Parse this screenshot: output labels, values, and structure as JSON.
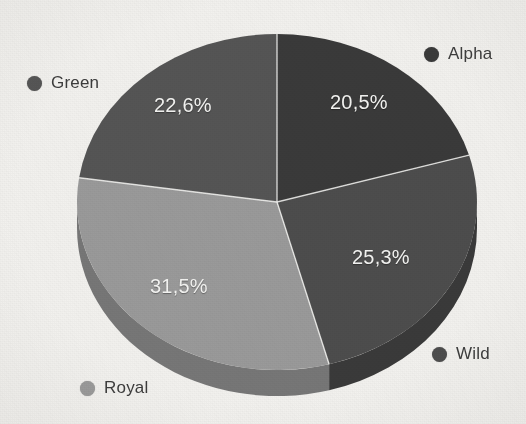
{
  "chart_data": {
    "type": "pie",
    "title": "",
    "subtitle": "",
    "xlabel": "",
    "ylabel": "",
    "decimal_separator": ",",
    "value_suffix": "%",
    "three_d": true,
    "start_angle_deg": 0,
    "direction": "clockwise",
    "legend_position": "around-pie",
    "grid": false,
    "categories": [
      "Alpha",
      "Wild",
      "Royal",
      "Green"
    ],
    "values": [
      20.5,
      25.3,
      31.5,
      22.6
    ],
    "labels": [
      "20,5%",
      "25,3%",
      "31,5%",
      "22,6%"
    ],
    "colors": [
      "#3a3a3a",
      "#4d4d4d",
      "#9a9a9a",
      "#555555"
    ],
    "side_colors": [
      "#2a2a2a",
      "#3a3a3a",
      "#777777",
      "#414141"
    ],
    "slices": [
      {
        "name": "Alpha",
        "value": 20.5,
        "label": "20,5%",
        "color": "#3a3a3a",
        "side_color": "#2a2a2a",
        "start_deg": 0,
        "end_deg": 73.8,
        "label_x": 330,
        "label_y": 91
      },
      {
        "name": "Wild",
        "value": 25.3,
        "label": "25,3%",
        "color": "#4d4d4d",
        "side_color": "#3a3a3a",
        "start_deg": 73.8,
        "end_deg": 164.9,
        "label_x": 352,
        "label_y": 246
      },
      {
        "name": "Royal",
        "value": 31.5,
        "label": "31,5%",
        "color": "#9a9a9a",
        "side_color": "#777777",
        "start_deg": 164.9,
        "end_deg": 278.3,
        "label_x": 150,
        "label_y": 275
      },
      {
        "name": "Green",
        "value": 22.6,
        "label": "22,6%",
        "color": "#555555",
        "side_color": "#414141",
        "start_deg": 278.3,
        "end_deg": 360,
        "label_x": 154,
        "label_y": 94
      }
    ]
  },
  "legend": {
    "items": [
      {
        "label": "Alpha",
        "color": "#3a3a3a",
        "x": 424,
        "y": 44
      },
      {
        "label": "Green",
        "color": "#555555",
        "x": 27,
        "y": 73
      },
      {
        "label": "Wild",
        "color": "#4d4d4d",
        "x": 432,
        "y": 344
      },
      {
        "label": "Royal",
        "color": "#9a9a9a",
        "x": 80,
        "y": 378
      }
    ]
  },
  "canvas": {
    "background": "#f2f1ee",
    "center_x": 277,
    "center_y": 202,
    "radius_x": 200,
    "radius_y": 168,
    "depth": 26
  }
}
